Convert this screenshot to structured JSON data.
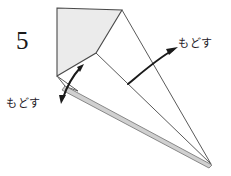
{
  "figure": {
    "type": "origami-fold-diagram",
    "step_number": "5",
    "background_color": "#ffffff",
    "line_color": "#3a3a3a",
    "fold_edge_color": "#8a8a8a",
    "shaded_fill": "#ebebeb",
    "arrow_color": "#1a1a1a",
    "text_color": "#23201f"
  },
  "annotations": [
    {
      "id": "annotation-right",
      "label": "もどす",
      "meaning": "unfold / return",
      "arrow": "curved-arrow-right",
      "position": "right"
    },
    {
      "id": "annotation-left",
      "label": "もどす",
      "meaning": "unfold / return",
      "arrow": "curved-arrow-left",
      "position": "left"
    }
  ],
  "geometry": {
    "shaded_panel_points": "57,8 122,10 96,53 57,76",
    "outline_points": "57,8 122,10 96,53 57,76",
    "left_edge": {
      "x1": 57,
      "y1": 8,
      "x2": 57,
      "y2": 76
    },
    "top_edge": {
      "x1": 57,
      "y1": 8,
      "x2": 122,
      "y2": 10
    },
    "diagonal_crease": {
      "x1": 122,
      "y1": 10,
      "x2": 57,
      "y2": 76
    },
    "apex_to_tip": {
      "x1": 122,
      "y1": 10,
      "x2": 211,
      "y2": 164
    },
    "inner_vertex_to_tip": {
      "x1": 96,
      "y1": 53,
      "x2": 211,
      "y2": 164
    },
    "flap_line": {
      "x1": 57,
      "y1": 76,
      "x2": 96,
      "y2": 53
    },
    "fold_band": "64,86 211,164 209,167 62,90",
    "small_flap": "57,76 78,90 64,86",
    "bottom_tip": {
      "x": 211,
      "y": 164
    }
  },
  "arrows": {
    "right": {
      "path": "M 128 84 C 140 74 158 58 176 49",
      "head_at": {
        "x": 176,
        "y": 49
      },
      "direction": "up-right"
    },
    "left": {
      "path": "M 81 67 C 72 78 66 90 62 101",
      "head_at": {
        "x": 62,
        "y": 101
      },
      "secondary_head_at": {
        "x": 81,
        "y": 67
      },
      "direction": "down-left"
    }
  }
}
